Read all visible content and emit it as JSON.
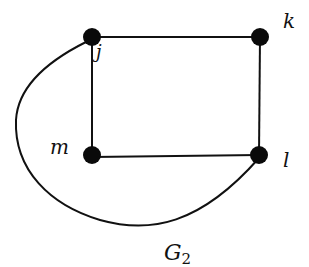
{
  "graph": {
    "title": "G",
    "title_subscript": "2",
    "nodes": [
      {
        "id": "j",
        "label": "j",
        "x": 92,
        "y": 37,
        "label_x": 96,
        "label_y": 60
      },
      {
        "id": "k",
        "label": "k",
        "x": 260,
        "y": 37,
        "label_x": 283,
        "label_y": 27
      },
      {
        "id": "m",
        "label": "m",
        "x": 92,
        "y": 155,
        "label_x": 52,
        "label_y": 153
      },
      {
        "id": "l",
        "label": "l",
        "x": 259,
        "y": 155,
        "label_x": 284,
        "label_y": 166
      }
    ],
    "edges": [
      {
        "from": "j",
        "to": "k",
        "type": "straight"
      },
      {
        "from": "k",
        "to": "l",
        "type": "straight"
      },
      {
        "from": "l",
        "to": "m",
        "type": "straight"
      },
      {
        "from": "m",
        "to": "j",
        "type": "straight"
      },
      {
        "from": "j",
        "to": "l",
        "type": "curve"
      }
    ],
    "colors": {
      "stroke": "#111111",
      "node_fill": "#0a0a0a",
      "background": "#ffffff"
    }
  }
}
